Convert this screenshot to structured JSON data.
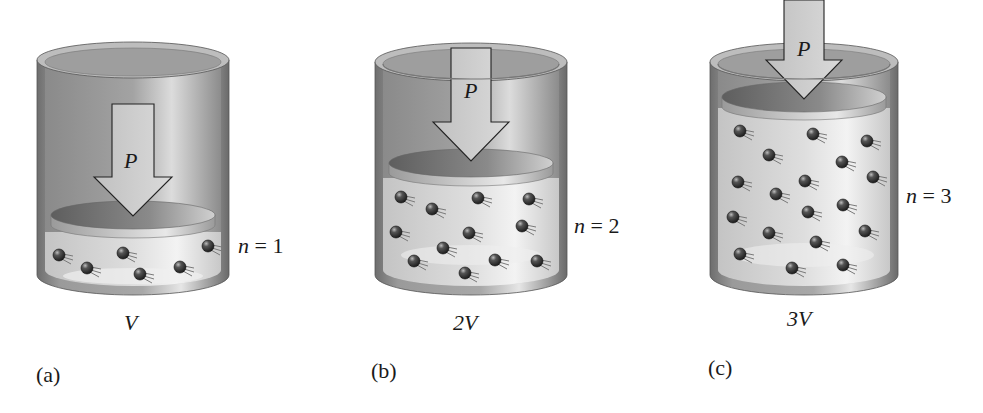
{
  "figure": {
    "panels": [
      {
        "id": "a",
        "panel_label": "(a)",
        "volume_label": "V",
        "moles_var": "n",
        "moles_eq": " = 1",
        "pressure_label": "P",
        "molecule_count": 6
      },
      {
        "id": "b",
        "panel_label": "(b)",
        "volume_label": "2V",
        "moles_var": "n",
        "moles_eq": " = 2",
        "pressure_label": "P",
        "molecule_count": 12
      },
      {
        "id": "c",
        "panel_label": "(c)",
        "volume_label": "3V",
        "moles_var": "n",
        "moles_eq": " = 3",
        "pressure_label": "P",
        "molecule_count": 18
      }
    ],
    "colors": {
      "cylinder_wall": "#8c8c8c",
      "cylinder_inner": "#b5b5b5",
      "gas_fill": "#e2e2e2",
      "piston_top": "#7a7a7a",
      "arrow_fill": "#cfcfcf",
      "molecule": "#3a3a3a"
    }
  }
}
